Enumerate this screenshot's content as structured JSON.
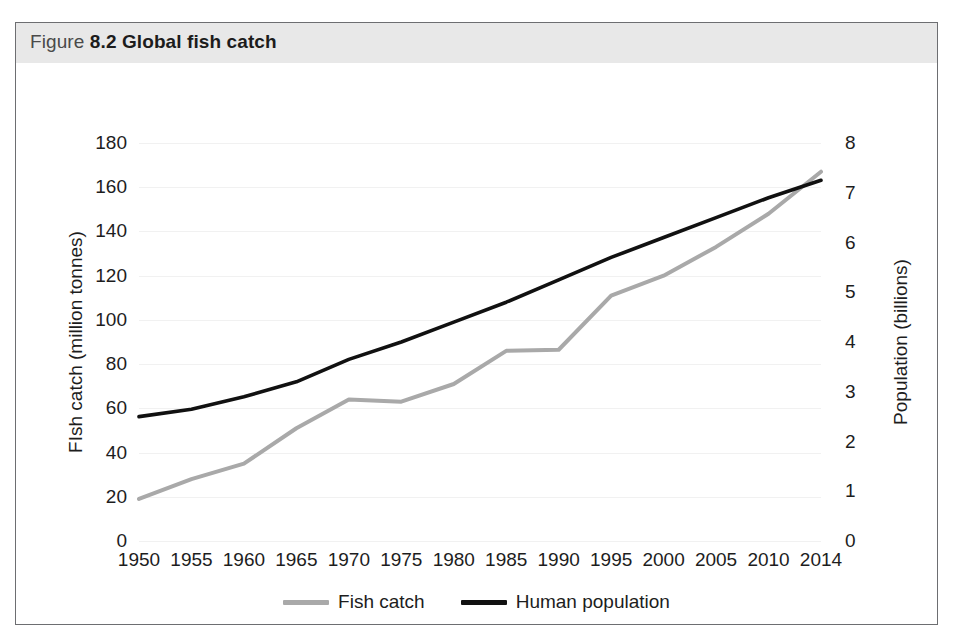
{
  "figure": {
    "title_prefix": "Figure",
    "title_main": "8.2 Global fish catch",
    "header_bg": "#e8e8e8",
    "border_color": "#6d6e71"
  },
  "axes": {
    "left": {
      "label": "FIsh catch (million tonnes)",
      "ticks": [
        0,
        20,
        40,
        60,
        80,
        100,
        120,
        140,
        160,
        180
      ],
      "min": 0,
      "max": 180
    },
    "right": {
      "label": "Population (billions)",
      "ticks": [
        0,
        1,
        2,
        3,
        4,
        5,
        6,
        7,
        8
      ],
      "min": 0,
      "max": 8
    },
    "x": {
      "label": "",
      "ticks": [
        "1950",
        "1955",
        "1960",
        "1965",
        "1970",
        "1975",
        "1980",
        "1985",
        "1990",
        "1995",
        "2000",
        "2005",
        "2010",
        "2014"
      ]
    }
  },
  "legend": {
    "position": "bottom-center",
    "items": [
      {
        "label": "Fish catch",
        "color": "#a9a9a9"
      },
      {
        "label": "Human population",
        "color": "#111111"
      }
    ]
  },
  "chart_data": {
    "type": "line",
    "title": "Figure 8.2 Global fish catch",
    "xlabel": "",
    "ylabel": "FIsh catch (million tonnes)",
    "y2label": "Population (billions)",
    "grid": true,
    "legend_position": "bottom-center",
    "categories": [
      "1950",
      "1955",
      "1960",
      "1965",
      "1970",
      "1975",
      "1980",
      "1985",
      "1990",
      "1995",
      "2000",
      "2005",
      "2010",
      "2014"
    ],
    "x": [
      1950,
      1955,
      1960,
      1965,
      1970,
      1975,
      1980,
      1985,
      1990,
      1995,
      2000,
      2005,
      2010,
      2014
    ],
    "ylim": [
      0,
      180
    ],
    "y2lim": [
      0,
      8
    ],
    "series": [
      {
        "name": "Fish catch",
        "axis": "left",
        "units": "million tonnes",
        "color": "#a9a9a9",
        "line_width": 4,
        "values": [
          19,
          28,
          35,
          51,
          64,
          63,
          71,
          86,
          86.5,
          111,
          120,
          133,
          148,
          167
        ]
      },
      {
        "name": "Human population",
        "axis": "right",
        "units": "billions",
        "color": "#111111",
        "line_width": 3.6,
        "values": [
          2.5,
          2.65,
          2.9,
          3.2,
          3.65,
          4.0,
          4.4,
          4.8,
          5.25,
          5.7,
          6.1,
          6.5,
          6.9,
          7.25
        ]
      }
    ]
  }
}
